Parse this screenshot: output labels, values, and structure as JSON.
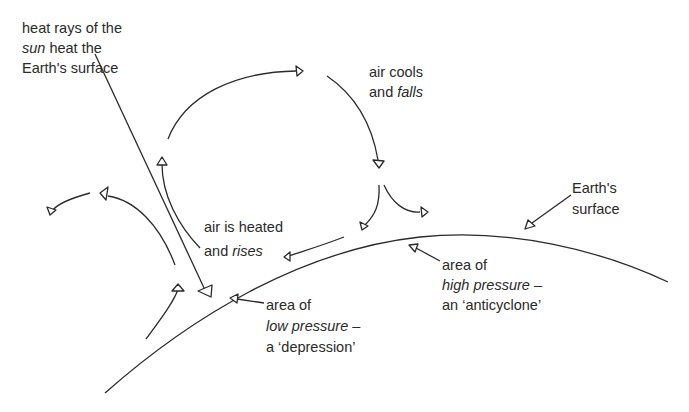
{
  "diagram": {
    "labels": {
      "sun_heat": {
        "line1": "heat rays of the",
        "line2_italic": "sun",
        "line2_rest": " heat the",
        "line3": "Earth's surface"
      },
      "air_cools": {
        "line1": "air cools",
        "line2_plain": "and ",
        "line2_italic": "falls"
      },
      "air_heated": {
        "line1": "air is heated",
        "line2_plain": "and ",
        "line2_italic": "rises"
      },
      "earth_surface": {
        "line1": "Earth's",
        "line2": "surface"
      },
      "high_pressure": {
        "line1": "area of",
        "line2_italic": "high pressure",
        "line2_rest": " –",
        "line3": "an ‘anticyclone’"
      },
      "low_pressure": {
        "line1": "area of",
        "line2_italic": "low pressure",
        "line2_rest": " –",
        "line3": "a ‘depression’"
      }
    },
    "colors": {
      "ink": "#2a2a2a",
      "background": "#ffffff"
    }
  }
}
